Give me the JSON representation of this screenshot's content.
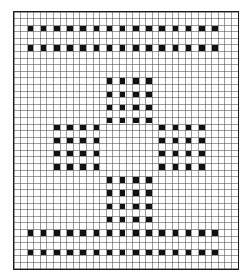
{
  "figure": {
    "caption": "",
    "background_color": "#ffffff",
    "border_color": "#1a1a1a",
    "gridline_color": "#4a4a4a",
    "filled_color": "#111111"
  },
  "chart_data": {
    "type": "heatmap",
    "subtitle": "",
    "xlabel": "",
    "ylabel": "",
    "xlim": [
      0,
      34
    ],
    "ylim": [
      0,
      39
    ],
    "grid": true,
    "legend": null,
    "legend_position": "none",
    "categories": [],
    "columns": 34,
    "rows": 39,
    "cell_size_px": 6.62,
    "value_map": {
      "0": "empty",
      "1": "filled"
    },
    "xticks": [],
    "yticks": [],
    "annotations": [],
    "filled_cells": [
      [
        2,
        2
      ],
      [
        2,
        4
      ],
      [
        2,
        6
      ],
      [
        2,
        8
      ],
      [
        2,
        10
      ],
      [
        2,
        12
      ],
      [
        2,
        14
      ],
      [
        2,
        16
      ],
      [
        2,
        18
      ],
      [
        2,
        20
      ],
      [
        2,
        22
      ],
      [
        2,
        24
      ],
      [
        2,
        26
      ],
      [
        2,
        28
      ],
      [
        2,
        30
      ],
      [
        5,
        2
      ],
      [
        5,
        4
      ],
      [
        5,
        6
      ],
      [
        5,
        8
      ],
      [
        5,
        10
      ],
      [
        5,
        12
      ],
      [
        5,
        14
      ],
      [
        5,
        16
      ],
      [
        5,
        18
      ],
      [
        5,
        20
      ],
      [
        5,
        22
      ],
      [
        5,
        24
      ],
      [
        5,
        26
      ],
      [
        5,
        28
      ],
      [
        5,
        30
      ],
      [
        10,
        14
      ],
      [
        10,
        16
      ],
      [
        10,
        18
      ],
      [
        10,
        20
      ],
      [
        12,
        14
      ],
      [
        12,
        16
      ],
      [
        12,
        18
      ],
      [
        12,
        20
      ],
      [
        14,
        14
      ],
      [
        14,
        16
      ],
      [
        14,
        18
      ],
      [
        14,
        20
      ],
      [
        16,
        14
      ],
      [
        16,
        16
      ],
      [
        16,
        18
      ],
      [
        16,
        20
      ],
      [
        17,
        6
      ],
      [
        17,
        8
      ],
      [
        17,
        10
      ],
      [
        17,
        12
      ],
      [
        19,
        6
      ],
      [
        19,
        8
      ],
      [
        19,
        10
      ],
      [
        19,
        12
      ],
      [
        21,
        6
      ],
      [
        21,
        8
      ],
      [
        21,
        10
      ],
      [
        21,
        12
      ],
      [
        23,
        6
      ],
      [
        23,
        8
      ],
      [
        23,
        10
      ],
      [
        23,
        12
      ],
      [
        17,
        22
      ],
      [
        17,
        24
      ],
      [
        17,
        26
      ],
      [
        17,
        28
      ],
      [
        19,
        22
      ],
      [
        19,
        24
      ],
      [
        19,
        26
      ],
      [
        19,
        28
      ],
      [
        21,
        22
      ],
      [
        21,
        24
      ],
      [
        21,
        26
      ],
      [
        21,
        28
      ],
      [
        23,
        22
      ],
      [
        23,
        24
      ],
      [
        23,
        26
      ],
      [
        23,
        28
      ],
      [
        25,
        14
      ],
      [
        25,
        16
      ],
      [
        25,
        18
      ],
      [
        25,
        20
      ],
      [
        27,
        14
      ],
      [
        27,
        16
      ],
      [
        27,
        18
      ],
      [
        27,
        20
      ],
      [
        29,
        14
      ],
      [
        29,
        16
      ],
      [
        29,
        18
      ],
      [
        29,
        20
      ],
      [
        31,
        14
      ],
      [
        31,
        16
      ],
      [
        31,
        18
      ],
      [
        31,
        20
      ],
      [
        33,
        2
      ],
      [
        33,
        4
      ],
      [
        33,
        6
      ],
      [
        33,
        8
      ],
      [
        33,
        10
      ],
      [
        33,
        12
      ],
      [
        33,
        14
      ],
      [
        33,
        16
      ],
      [
        33,
        18
      ],
      [
        33,
        20
      ],
      [
        33,
        22
      ],
      [
        33,
        24
      ],
      [
        33,
        26
      ],
      [
        33,
        28
      ],
      [
        33,
        30
      ],
      [
        36,
        2
      ],
      [
        36,
        4
      ],
      [
        36,
        6
      ],
      [
        36,
        8
      ],
      [
        36,
        10
      ],
      [
        36,
        12
      ],
      [
        36,
        14
      ],
      [
        36,
        16
      ],
      [
        36,
        18
      ],
      [
        36,
        20
      ],
      [
        36,
        22
      ],
      [
        36,
        24
      ],
      [
        36,
        26
      ],
      [
        36,
        28
      ],
      [
        36,
        30
      ]
    ]
  }
}
